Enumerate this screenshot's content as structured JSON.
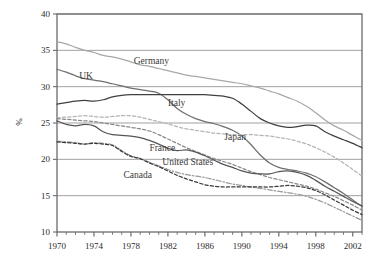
{
  "chart_data": {
    "type": "line",
    "title": "",
    "subtitle": "",
    "xlabel": "",
    "ylabel": "%",
    "xlim": [
      1970,
      2003
    ],
    "ylim": [
      10,
      40
    ],
    "grid": true,
    "grid_axis": "y",
    "legend_position": "inline-labels",
    "x": [
      1970,
      1971,
      1972,
      1973,
      1974,
      1975,
      1976,
      1977,
      1978,
      1979,
      1980,
      1981,
      1982,
      1983,
      1984,
      1985,
      1986,
      1987,
      1988,
      1989,
      1990,
      1991,
      1992,
      1993,
      1994,
      1995,
      1996,
      1997,
      1998,
      1999,
      2000,
      2001,
      2002,
      2003
    ],
    "xticks_major": [
      1970,
      1974,
      1978,
      1982,
      1986,
      1990,
      1994,
      1998,
      2002
    ],
    "xticklabels": [
      "1970",
      "1974",
      "1978",
      "1982",
      "1986",
      "1990",
      "1994",
      "1998",
      "2002"
    ],
    "yticks": [
      10,
      15,
      20,
      25,
      30,
      35,
      40
    ],
    "yticklabels": [
      "10",
      "15",
      "20",
      "25",
      "30",
      "35",
      "40"
    ],
    "series": [
      {
        "name": "Germany",
        "label": "Germany",
        "color": "#a8a8a8",
        "style": "solid",
        "label_x": 1978.3,
        "label_y": 33.1,
        "values": [
          36.2,
          35.9,
          35.4,
          35.0,
          34.7,
          34.3,
          34.1,
          33.8,
          33.4,
          33.0,
          32.8,
          32.5,
          32.2,
          31.9,
          31.6,
          31.4,
          31.2,
          31.0,
          30.8,
          30.6,
          30.4,
          30.1,
          29.8,
          29.4,
          29.0,
          28.5,
          28.0,
          27.3,
          26.4,
          25.4,
          24.6,
          24.0,
          23.3,
          22.6
        ]
      },
      {
        "name": "UK",
        "label": "UK",
        "color": "#6e6e6e",
        "style": "solid",
        "label_x": 1972.4,
        "label_y": 31.0,
        "values": [
          32.4,
          32.0,
          31.5,
          31.1,
          30.9,
          30.7,
          30.4,
          30.1,
          29.8,
          29.6,
          29.4,
          29.1,
          28.2,
          27.0,
          26.2,
          25.6,
          25.2,
          24.9,
          24.5,
          24.0,
          23.2,
          22.0,
          20.6,
          19.5,
          18.9,
          18.6,
          18.4,
          18.1,
          17.6,
          16.9,
          16.1,
          15.3,
          14.4,
          13.5
        ]
      },
      {
        "name": "Italy",
        "label": "Italy",
        "color": "#404040",
        "style": "solid",
        "label_x": 1982.0,
        "label_y": 27.4,
        "values": [
          27.6,
          27.8,
          28.0,
          28.1,
          28.0,
          28.2,
          28.6,
          28.8,
          28.9,
          28.9,
          28.9,
          28.9,
          28.9,
          28.9,
          28.9,
          28.9,
          28.9,
          28.8,
          28.7,
          28.4,
          27.6,
          26.6,
          25.6,
          25.0,
          24.6,
          24.4,
          24.5,
          24.7,
          24.6,
          23.8,
          23.2,
          22.7,
          22.2,
          21.6
        ]
      },
      {
        "name": "Japan",
        "label": "Japan",
        "color": "#b4b4b4",
        "style": "dashed",
        "label_x": 1988.1,
        "label_y": 22.6,
        "values": [
          25.7,
          25.8,
          25.9,
          26.0,
          25.9,
          25.8,
          25.9,
          26.0,
          26.0,
          25.8,
          25.5,
          25.2,
          24.9,
          24.5,
          24.2,
          24.0,
          23.8,
          23.6,
          23.5,
          23.4,
          23.4,
          23.4,
          23.3,
          23.2,
          23.0,
          22.8,
          22.5,
          22.1,
          21.6,
          21.0,
          20.3,
          19.5,
          18.6,
          17.7
        ]
      },
      {
        "name": "France",
        "label": "France",
        "color": "#888888",
        "style": "dashed",
        "label_x": 1980.0,
        "label_y": 21.1,
        "values": [
          25.6,
          25.5,
          25.4,
          25.3,
          25.2,
          25.0,
          24.8,
          24.6,
          24.4,
          24.2,
          23.9,
          23.4,
          22.8,
          22.2,
          21.6,
          21.1,
          20.6,
          20.1,
          19.7,
          19.3,
          18.8,
          18.3,
          17.9,
          17.5,
          17.2,
          16.9,
          16.6,
          16.3,
          15.9,
          15.4,
          14.9,
          14.3,
          13.7,
          13.0
        ]
      },
      {
        "name": "United States",
        "label": "United States",
        "color": "#555555",
        "style": "solid",
        "label_x": 1981.4,
        "label_y": 19.2,
        "values": [
          25.3,
          24.8,
          24.6,
          24.8,
          24.6,
          23.8,
          23.4,
          23.3,
          23.2,
          23.0,
          22.6,
          22.1,
          21.5,
          21.2,
          21.3,
          21.0,
          20.5,
          19.9,
          19.3,
          18.9,
          18.4,
          18.1,
          18.0,
          18.0,
          18.3,
          18.4,
          18.2,
          17.8,
          17.1,
          16.3,
          15.6,
          14.9,
          14.2,
          13.6
        ]
      },
      {
        "name": "Canada",
        "label": "Canada",
        "color": "#9a9a9a",
        "style": "dashdot",
        "label_x": 1977.2,
        "label_y": 17.4,
        "values": [
          22.5,
          22.4,
          22.3,
          22.1,
          22.3,
          22.2,
          22.0,
          21.2,
          20.5,
          20.1,
          19.6,
          19.1,
          18.6,
          18.2,
          17.9,
          17.7,
          17.5,
          17.2,
          16.9,
          16.6,
          16.4,
          16.2,
          16.0,
          15.8,
          15.6,
          15.4,
          15.2,
          14.9,
          14.5,
          14.0,
          13.4,
          12.8,
          12.2,
          11.6
        ]
      },
      {
        "name": "Canada-dark",
        "label": "",
        "color": "#3a3a3a",
        "style": "dashed",
        "label_x": 0,
        "label_y": 0,
        "values": [
          22.4,
          22.3,
          22.2,
          22.1,
          22.2,
          22.1,
          21.9,
          21.1,
          20.4,
          20.1,
          19.5,
          19.0,
          18.4,
          17.8,
          17.3,
          16.9,
          16.5,
          16.3,
          16.2,
          16.2,
          16.2,
          16.2,
          16.2,
          16.2,
          16.3,
          16.4,
          16.3,
          16.1,
          15.7,
          15.1,
          14.4,
          13.7,
          13.0,
          12.4
        ]
      }
    ]
  },
  "axis": {
    "ylabel": "%",
    "y_tick_labels": [
      "40",
      "35",
      "30",
      "25",
      "20",
      "15",
      "10"
    ],
    "x_tick_labels": [
      "1970",
      "1974",
      "1978",
      "1982",
      "1986",
      "1990",
      "1994",
      "1998",
      "2002"
    ]
  },
  "colors": {
    "frame": "#6b6b6b",
    "grid": "#7a7a7a",
    "background": "#ffffff",
    "text": "#2b2b2b"
  }
}
